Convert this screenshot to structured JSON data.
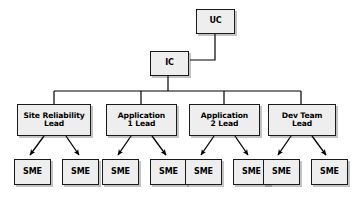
{
  "diagram": {
    "type": "org-chart",
    "background_color": "#ffffff",
    "node_fill_color": "#eeeeee",
    "node_border_color": "#1a1a1a",
    "edge_color": "#000000",
    "nodes": {
      "uc": {
        "label": "UC",
        "level": 0
      },
      "ic": {
        "label": "IC",
        "level": 1
      },
      "lead_1": {
        "label": "Site Reliability\nLead",
        "level": 2
      },
      "lead_2": {
        "label": "Application\n1 Lead",
        "level": 2
      },
      "lead_3": {
        "label": "Application\n2 Lead",
        "level": 2
      },
      "lead_4": {
        "label": "Dev Team\nLead",
        "level": 2
      },
      "sme_1": {
        "label": "SME",
        "level": 3
      },
      "sme_2": {
        "label": "SME",
        "level": 3
      },
      "sme_3": {
        "label": "SME",
        "level": 3
      },
      "sme_4": {
        "label": "SME",
        "level": 3
      },
      "sme_5": {
        "label": "SME",
        "level": 3
      },
      "sme_6": {
        "label": "SME",
        "level": 3
      },
      "sme_7": {
        "label": "SME",
        "level": 3
      },
      "sme_8": {
        "label": "SME",
        "level": 3
      }
    },
    "edges": [
      {
        "from": "uc",
        "to": "ic",
        "style": "elbow",
        "arrow": "none"
      },
      {
        "from": "ic",
        "to": "lead_1",
        "style": "orthogonal",
        "arrow": "none"
      },
      {
        "from": "ic",
        "to": "lead_2",
        "style": "orthogonal",
        "arrow": "none"
      },
      {
        "from": "ic",
        "to": "lead_3",
        "style": "orthogonal",
        "arrow": "none"
      },
      {
        "from": "ic",
        "to": "lead_4",
        "style": "orthogonal",
        "arrow": "none"
      },
      {
        "from": "lead_1",
        "to": "sme_1",
        "style": "straight",
        "arrow": "both"
      },
      {
        "from": "lead_1",
        "to": "sme_2",
        "style": "straight",
        "arrow": "both"
      },
      {
        "from": "lead_2",
        "to": "sme_3",
        "style": "straight",
        "arrow": "both"
      },
      {
        "from": "lead_2",
        "to": "sme_4",
        "style": "straight",
        "arrow": "both"
      },
      {
        "from": "lead_3",
        "to": "sme_5",
        "style": "straight",
        "arrow": "both"
      },
      {
        "from": "lead_3",
        "to": "sme_6",
        "style": "straight",
        "arrow": "both"
      },
      {
        "from": "lead_4",
        "to": "sme_7",
        "style": "straight",
        "arrow": "both"
      },
      {
        "from": "lead_4",
        "to": "sme_8",
        "style": "straight",
        "arrow": "both"
      }
    ]
  }
}
